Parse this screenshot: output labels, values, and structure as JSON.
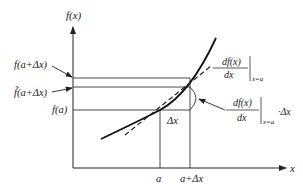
{
  "diagram": {
    "axes": {
      "y_label": "f(x)",
      "x_label": "x"
    },
    "y_labels": {
      "f_a_plus_dx": "f(a+Δx)",
      "f_tilde_a_plus_dx": "f̃(a+Δx)",
      "f_a": "f(a)"
    },
    "x_labels": {
      "a": "a",
      "a_plus_dx": "a+Δx"
    },
    "delta_x_label": "Δx",
    "derivative_annotation": {
      "numerator": "df(x)",
      "denominator": "dx",
      "eval_at": "x=a"
    },
    "increment_annotation": {
      "numerator": "df(x)",
      "denominator": "dx",
      "eval_at": "x=a",
      "suffix": "·Δx"
    },
    "colors": {
      "line": "#222222",
      "background": "#ffffff"
    }
  }
}
